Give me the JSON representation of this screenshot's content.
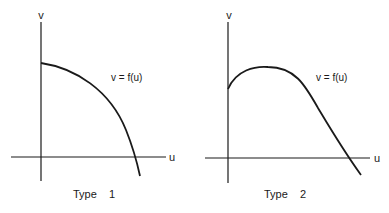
{
  "figure": {
    "panels": [
      {
        "id": "type1",
        "caption": "Type    1",
        "x_axis_label": "u",
        "y_axis_label": "v",
        "curve_label": "v = f(u)",
        "curve_shape": "concave-down, monotonically decreasing from positive v-intercept, crossing u-axis"
      },
      {
        "id": "type2",
        "caption": "Type    2",
        "x_axis_label": "u",
        "y_axis_label": "v",
        "curve_label": "v = f(u)",
        "curve_shape": "rises from positive v-intercept to a maximum, then decreases crossing u-axis"
      }
    ],
    "colors": {
      "line": "#1a1a1a",
      "background": "#ffffff"
    }
  }
}
